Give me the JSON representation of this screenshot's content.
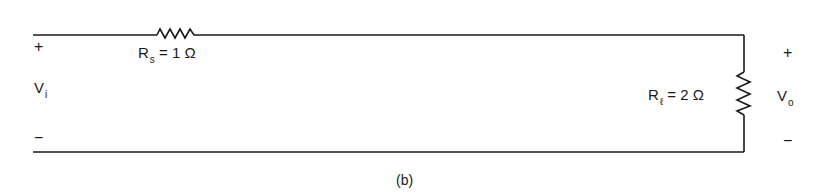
{
  "figure": {
    "caption": "(b)",
    "stroke_color": "#1a1a1a",
    "background": "#ffffff"
  },
  "input": {
    "plus": "+",
    "minus": "−",
    "symbol": "V",
    "subscript": "i"
  },
  "output": {
    "plus": "+",
    "minus": "−",
    "symbol": "V",
    "subscript": "o"
  },
  "series_resistor": {
    "symbol": "R",
    "subscript": "s",
    "value_text": "= 1 Ω"
  },
  "load_resistor": {
    "symbol": "R",
    "subscript": "ℓ",
    "value_text": "= 2 Ω"
  }
}
